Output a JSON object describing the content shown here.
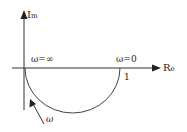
{
  "diagram": {
    "type": "nyquist-plot",
    "axes": {
      "y_label_main": "I",
      "y_label_sub": "m",
      "x_label_main": "R",
      "x_label_sub": "e"
    },
    "labels": {
      "omega_inf": "ω=∞",
      "omega_zero": "ω=0",
      "real_intercept": "1",
      "direction": "ω"
    },
    "colors": {
      "line": "#333333",
      "text": "#222222",
      "background": "#ffffff"
    }
  }
}
